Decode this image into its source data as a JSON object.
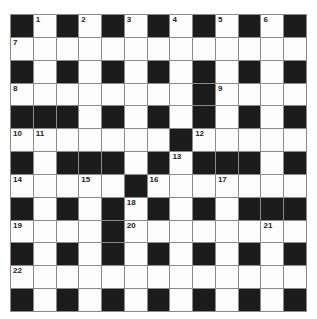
{
  "puzzle": {
    "type": "crossword",
    "rows": 13,
    "cols": 13,
    "colors": {
      "black": "#1c1c1c",
      "white": "#fdfdfd",
      "grid_line": "#8a8a8a"
    },
    "grid": [
      [
        "#",
        "1",
        "#",
        "2",
        "#",
        "3",
        "#",
        "4",
        "#",
        "5",
        "#",
        "6",
        "#"
      ],
      [
        "7",
        ".",
        ".",
        ".",
        ".",
        ".",
        ".",
        ".",
        ".",
        ".",
        ".",
        ".",
        "."
      ],
      [
        "#",
        ".",
        "#",
        ".",
        "#",
        ".",
        "#",
        ".",
        "#",
        ".",
        "#",
        ".",
        "#"
      ],
      [
        "8",
        ".",
        ".",
        ".",
        ".",
        ".",
        ".",
        ".",
        "#",
        "9",
        ".",
        ".",
        "."
      ],
      [
        "#",
        "#",
        "#",
        ".",
        "#",
        ".",
        "#",
        ".",
        "#",
        ".",
        "#",
        ".",
        "#"
      ],
      [
        "10",
        "11",
        ".",
        ".",
        ".",
        ".",
        ".",
        "#",
        "12",
        ".",
        ".",
        ".",
        "."
      ],
      [
        "#",
        ".",
        "#",
        "#",
        "#",
        ".",
        "#",
        "13",
        "#",
        "#",
        "#",
        ".",
        "#"
      ],
      [
        "14",
        ".",
        ".",
        "15",
        ".",
        "#",
        "16",
        ".",
        ".",
        "17",
        ".",
        ".",
        "."
      ],
      [
        "#",
        ".",
        "#",
        ".",
        "#",
        "18",
        "#",
        ".",
        "#",
        ".",
        "#",
        "#",
        "#"
      ],
      [
        "19",
        ".",
        ".",
        ".",
        "#",
        "20",
        ".",
        ".",
        ".",
        ".",
        ".",
        "21",
        "."
      ],
      [
        "#",
        ".",
        "#",
        ".",
        "#",
        ".",
        "#",
        ".",
        "#",
        ".",
        "#",
        ".",
        "#"
      ],
      [
        "22",
        ".",
        ".",
        ".",
        ".",
        ".",
        ".",
        ".",
        ".",
        ".",
        ".",
        ".",
        "."
      ],
      [
        "#",
        ".",
        "#",
        ".",
        "#",
        ".",
        "#",
        ".",
        "#",
        ".",
        "#",
        ".",
        "#"
      ]
    ]
  }
}
